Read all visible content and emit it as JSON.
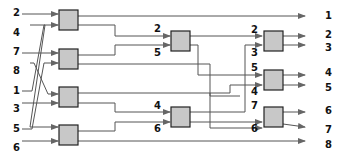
{
  "diagram": {
    "inputs": [
      "2",
      "4",
      "7",
      "8",
      "1",
      "3",
      "5",
      "6"
    ],
    "outputs": [
      "1",
      "2",
      "3",
      "4",
      "5",
      "6",
      "7",
      "8"
    ],
    "stage2_labels": [
      "2",
      "5",
      "4",
      "6"
    ],
    "stage3_labels": [
      "2",
      "3",
      "5",
      "4",
      "7",
      "6"
    ],
    "colors": {
      "box_fill": "#c8c8c8",
      "box_stroke": "#222222",
      "wire": "#555555"
    }
  }
}
